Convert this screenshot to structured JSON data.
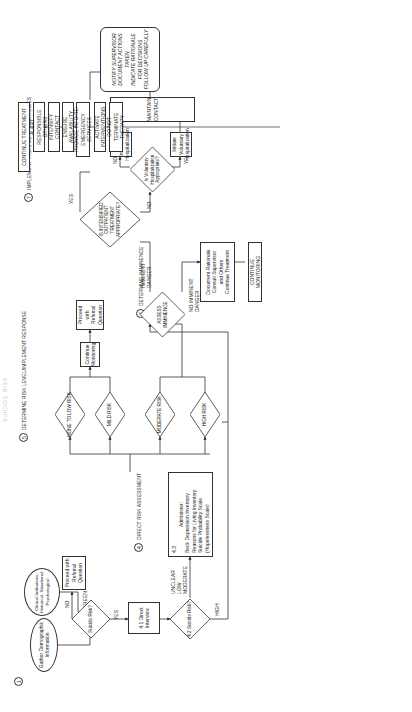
{
  "page": {
    "header": "SUICIDE RISK"
  },
  "steps": {
    "s1": {
      "num": "1"
    },
    "s2": {
      "num": "2"
    },
    "s3": {
      "num": "3",
      "label": "SCREEN"
    },
    "s4": {
      "num": "4",
      "label": "DIRECT RISK ASSESSMENT"
    },
    "s5": {
      "num": "5",
      "label": "DETERMINE RISK LEVEL/IMPLEMENT RESPONSE"
    },
    "s6": {
      "num": "6",
      "label": "DETERMINE IMMINENCE"
    },
    "s7": {
      "num": "7",
      "label": "IMPLEMENT TREATMENT STRATEGIES"
    }
  },
  "nodes": {
    "gather_demographic": "Gather Demographic Information",
    "clinical_indications": "Clinical Indications: Historical- Situational; Psychological",
    "suicide_risk_screen": "Suicide Risk?",
    "proceed_referral_1": "Proceed with Referral Question",
    "direct_interview": "4.1 Direct Interview",
    "suicide_risk_42": "4.2 Suicide Risk?",
    "administer_43": {
      "num": "4.3",
      "title": "Administer:",
      "items": [
        "Beck Depression Inventory",
        "Reasons for Living Inventory",
        "Suicide Probability Scale",
        "(Hopelessness Scale)"
      ]
    },
    "none_low_risk": "NONE TO LOW RISK",
    "mild_risk": "MILD RISK",
    "moderate_risk": "MODERATE RISK",
    "high_risk": "HIGH RISK",
    "continue_monitoring_1": "Continue Monitoring",
    "proceed_referral_2": "Proceed with Referral Question",
    "assess_imminence": "ASSESS IMMINENCE",
    "document_rationale": [
      "Document Rationale",
      "Consult Supervisor",
      "and Others",
      "Continue Treatment"
    ],
    "continue_monitoring_2": "CONTINUE MONITORING",
    "intensified_outpatient": "IS INTENSIFIED OUTPATIENT TREATMENT APPROPRIATE?",
    "voluntary_hosp_q": "Is Voluntary Hospitalization Appropriate?",
    "initiate_voluntary": "Initiate Voluntary Hospitalization",
    "initiate_involuntary": "Initiate Involuntary Hospitalization",
    "maintain_contact": "MAINTAIN CONTACT",
    "continue_treatment": "CONTINUE TREATMENT",
    "alert_responsible": "ALERT RESPONSIBLE OTHERS",
    "intensify_contact": "INTENSIFY CONTACT",
    "ensure_availability": "ENSURE AVAILABILITY",
    "provide_info": "PROVIDE INFO RE: EMERGENCY SERVICES",
    "activate_interventions": "ACTIVATE INTERVENTIONS",
    "do_not_terminate": "DO NOT TERMINATE THERAPY",
    "notify_supervisor": [
      "NOTIFY SUPERVISOR",
      "DOCUMENT ACTIONS TAKEN",
      "INDICATE RATIONALE FOR DECISIONS",
      "FOLLOW UP CAREFULLY"
    ]
  },
  "edge_labels": {
    "yes_screen": "YES",
    "no_screen": "NO",
    "unclear_low_moderate": "UNCLEAR LOW MODERATE",
    "high": "HIGH",
    "imminent_danger": "IMMINENT DANGER",
    "no_imminent_danger": "NO IMMINENT DANGER",
    "yes_outpatient": "YES",
    "no_outpatient": "NO",
    "yes_voluntary": "YES",
    "no_voluntary": "NO"
  }
}
